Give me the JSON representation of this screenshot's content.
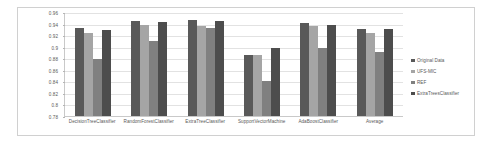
{
  "chart_data": {
    "type": "bar",
    "title": "",
    "subtitle": "",
    "xlabel": "",
    "ylabel": "",
    "ylim": [
      0.78,
      0.96
    ],
    "yticks": [
      "0.78",
      "0.8",
      "0.82",
      "0.84",
      "0.86",
      "0.88",
      "0.9",
      "0.92",
      "0.94",
      "0.96"
    ],
    "ytick_values": [
      0.78,
      0.8,
      0.82,
      0.84,
      0.86,
      0.88,
      0.9,
      0.92,
      0.94,
      0.96
    ],
    "grid": true,
    "legend_position": "right",
    "categories": [
      "DecisionTreeClassifier",
      "RandomForestClassifier",
      "ExtraTreeClassifier",
      "SupportVectorMachine",
      "AdaBoostClassifier",
      "Average"
    ],
    "series": [
      {
        "name": "Original Data",
        "color": "#595959",
        "values": [
          0.932,
          0.945,
          0.947,
          0.886,
          0.941,
          0.93
        ]
      },
      {
        "name": "UFS-MIC",
        "color": "#a5a5a5",
        "values": [
          0.923,
          0.937,
          0.936,
          0.886,
          0.936,
          0.923
        ]
      },
      {
        "name": "REF",
        "color": "#808080",
        "values": [
          0.878,
          0.91,
          0.932,
          0.84,
          0.897,
          0.891
        ]
      },
      {
        "name": "ExtraTreesClassifier",
        "color": "#4d4d4d",
        "values": [
          0.929,
          0.943,
          0.944,
          0.897,
          0.938,
          0.93
        ]
      }
    ]
  }
}
